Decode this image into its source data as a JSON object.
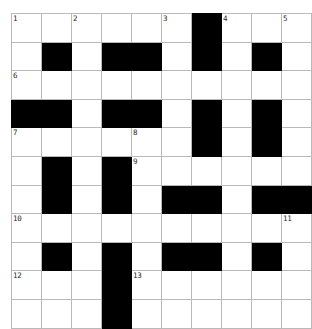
{
  "puzzle": {
    "type": "crossword-grid",
    "title": "",
    "rows": 11,
    "cols": 10,
    "cell_size_px": 29,
    "colors": {
      "block": "#000000",
      "empty": "#ffffff",
      "grid_line": "#b9b9b9",
      "number_text": "#2b2b2b",
      "page_background": "#ffffff"
    },
    "legend": {
      "block_symbol": "#",
      "empty_symbol": "."
    },
    "grid": [
      "......#...",
      ".#.##.#.#.",
      "..........",
      "##.##.#.#.",
      "......#.#.",
      ".#.#......",
      ".#.#.##.##",
      "..........",
      ".#.#.##.#.",
      "...#......",
      "...#......"
    ],
    "numbers": [
      {
        "label": "1",
        "row": 1,
        "col": 1
      },
      {
        "label": "2",
        "row": 1,
        "col": 3
      },
      {
        "label": "3",
        "row": 1,
        "col": 6
      },
      {
        "label": "4",
        "row": 1,
        "col": 8
      },
      {
        "label": "5",
        "row": 1,
        "col": 10
      },
      {
        "label": "6",
        "row": 3,
        "col": 1
      },
      {
        "label": "7",
        "row": 5,
        "col": 1
      },
      {
        "label": "8",
        "row": 5,
        "col": 5
      },
      {
        "label": "9",
        "row": 6,
        "col": 5
      },
      {
        "label": "10",
        "row": 8,
        "col": 1
      },
      {
        "label": "11",
        "row": 8,
        "col": 10
      },
      {
        "label": "12",
        "row": 10,
        "col": 1
      },
      {
        "label": "13",
        "row": 10,
        "col": 5
      }
    ]
  }
}
